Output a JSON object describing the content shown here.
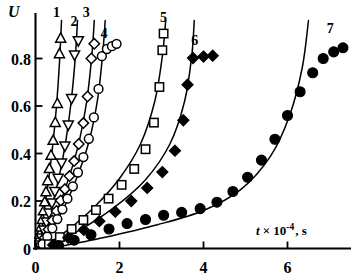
{
  "chart_data": {
    "type": "scatter",
    "title": "",
    "xlabel": "t × 10⁻⁴, s",
    "ylabel": "U",
    "xlim": [
      -0.15,
      7.6
    ],
    "ylim": [
      -0.02,
      0.97
    ],
    "xticks": [
      0,
      2,
      4,
      6
    ],
    "xticklabels": [
      "0",
      "2",
      "4",
      "6"
    ],
    "yticks": [
      0,
      0.2,
      0.4,
      0.6,
      0.8
    ],
    "yticklabels": [
      "0",
      "0.2",
      "0.4",
      "0.6",
      "0.8"
    ],
    "grid": false,
    "legend_position": "inline-curve-labels",
    "axis_label_u": "U",
    "axis_label_t_var": "t",
    "axis_label_t_mult": "× 10",
    "axis_label_t_exp": "-4",
    "axis_label_t_unit": ", s",
    "series": [
      {
        "name": "1",
        "label": "1",
        "marker": "triangle-up",
        "filled": false,
        "label_x": 0.5,
        "label_y": 0.975,
        "points": [
          {
            "x": 0.04,
            "y": 0.012
          },
          {
            "x": 0.07,
            "y": 0.035
          },
          {
            "x": 0.1,
            "y": 0.06
          },
          {
            "x": 0.13,
            "y": 0.09
          },
          {
            "x": 0.16,
            "y": 0.122
          },
          {
            "x": 0.19,
            "y": 0.158
          },
          {
            "x": 0.22,
            "y": 0.196
          },
          {
            "x": 0.25,
            "y": 0.238
          },
          {
            "x": 0.29,
            "y": 0.285
          },
          {
            "x": 0.33,
            "y": 0.336
          },
          {
            "x": 0.37,
            "y": 0.392
          },
          {
            "x": 0.42,
            "y": 0.455
          },
          {
            "x": 0.47,
            "y": 0.53
          },
          {
            "x": 0.52,
            "y": 0.61
          },
          {
            "x": 0.57,
            "y": 0.82
          },
          {
            "x": 0.6,
            "y": 0.885
          }
        ],
        "curve": [
          {
            "x": 0.02,
            "y": 0.0
          },
          {
            "x": 0.12,
            "y": 0.075
          },
          {
            "x": 0.22,
            "y": 0.175
          },
          {
            "x": 0.32,
            "y": 0.3
          },
          {
            "x": 0.42,
            "y": 0.45
          },
          {
            "x": 0.5,
            "y": 0.6
          },
          {
            "x": 0.57,
            "y": 0.78
          },
          {
            "x": 0.62,
            "y": 0.96
          }
        ]
      },
      {
        "name": "2",
        "label": "2",
        "marker": "triangle-down",
        "filled": false,
        "label_x": 0.92,
        "label_y": 0.935,
        "points": [
          {
            "x": 0.08,
            "y": 0.015
          },
          {
            "x": 0.14,
            "y": 0.045
          },
          {
            "x": 0.2,
            "y": 0.078
          },
          {
            "x": 0.26,
            "y": 0.112
          },
          {
            "x": 0.32,
            "y": 0.15
          },
          {
            "x": 0.39,
            "y": 0.192
          },
          {
            "x": 0.46,
            "y": 0.24
          },
          {
            "x": 0.54,
            "y": 0.296
          },
          {
            "x": 0.62,
            "y": 0.36
          },
          {
            "x": 0.7,
            "y": 0.432
          },
          {
            "x": 0.78,
            "y": 0.52
          },
          {
            "x": 0.86,
            "y": 0.632
          },
          {
            "x": 0.93,
            "y": 0.815
          },
          {
            "x": 1.02,
            "y": 0.875
          }
        ],
        "curve": [
          {
            "x": 0.04,
            "y": 0.0
          },
          {
            "x": 0.2,
            "y": 0.07
          },
          {
            "x": 0.38,
            "y": 0.17
          },
          {
            "x": 0.56,
            "y": 0.3
          },
          {
            "x": 0.72,
            "y": 0.45
          },
          {
            "x": 0.85,
            "y": 0.62
          },
          {
            "x": 0.95,
            "y": 0.81
          },
          {
            "x": 1.0,
            "y": 0.96
          }
        ]
      },
      {
        "name": "3",
        "label": "3",
        "marker": "diamond",
        "filled": false,
        "label_x": 1.21,
        "label_y": 0.975,
        "points": [
          {
            "x": 0.13,
            "y": 0.015
          },
          {
            "x": 0.22,
            "y": 0.045
          },
          {
            "x": 0.31,
            "y": 0.08
          },
          {
            "x": 0.4,
            "y": 0.118
          },
          {
            "x": 0.5,
            "y": 0.158
          },
          {
            "x": 0.6,
            "y": 0.202
          },
          {
            "x": 0.7,
            "y": 0.25
          },
          {
            "x": 0.81,
            "y": 0.305
          },
          {
            "x": 0.92,
            "y": 0.368
          },
          {
            "x": 1.03,
            "y": 0.44
          },
          {
            "x": 1.14,
            "y": 0.528
          },
          {
            "x": 1.24,
            "y": 0.64
          },
          {
            "x": 1.33,
            "y": 0.8
          },
          {
            "x": 1.4,
            "y": 0.862
          }
        ],
        "curve": [
          {
            "x": 0.06,
            "y": 0.0
          },
          {
            "x": 0.3,
            "y": 0.075
          },
          {
            "x": 0.55,
            "y": 0.175
          },
          {
            "x": 0.8,
            "y": 0.3
          },
          {
            "x": 1.04,
            "y": 0.45
          },
          {
            "x": 1.22,
            "y": 0.62
          },
          {
            "x": 1.34,
            "y": 0.81
          },
          {
            "x": 1.4,
            "y": 0.96
          }
        ]
      },
      {
        "name": "4",
        "label": "4",
        "marker": "circle",
        "filled": false,
        "label_x": 1.63,
        "label_y": 0.885,
        "points": [
          {
            "x": 0.17,
            "y": 0.018
          },
          {
            "x": 0.28,
            "y": 0.05
          },
          {
            "x": 0.4,
            "y": 0.085
          },
          {
            "x": 0.52,
            "y": 0.124
          },
          {
            "x": 0.64,
            "y": 0.165
          },
          {
            "x": 0.76,
            "y": 0.21
          },
          {
            "x": 0.89,
            "y": 0.262
          },
          {
            "x": 1.01,
            "y": 0.32
          },
          {
            "x": 1.14,
            "y": 0.385
          },
          {
            "x": 1.27,
            "y": 0.462
          },
          {
            "x": 1.39,
            "y": 0.552
          },
          {
            "x": 1.5,
            "y": 0.672
          },
          {
            "x": 1.58,
            "y": 0.81
          },
          {
            "x": 1.7,
            "y": 0.84
          },
          {
            "x": 1.82,
            "y": 0.852
          },
          {
            "x": 1.93,
            "y": 0.862
          }
        ],
        "curve": [
          {
            "x": 0.08,
            "y": 0.0
          },
          {
            "x": 0.38,
            "y": 0.078
          },
          {
            "x": 0.7,
            "y": 0.18
          },
          {
            "x": 1.0,
            "y": 0.305
          },
          {
            "x": 1.28,
            "y": 0.455
          },
          {
            "x": 1.48,
            "y": 0.63
          },
          {
            "x": 1.6,
            "y": 0.82
          },
          {
            "x": 1.66,
            "y": 0.96
          }
        ]
      },
      {
        "name": "5",
        "label": "5",
        "marker": "square",
        "filled": false,
        "label_x": 3.05,
        "label_y": 0.955,
        "points": [
          {
            "x": 0.32,
            "y": 0.018
          },
          {
            "x": 0.58,
            "y": 0.048
          },
          {
            "x": 0.86,
            "y": 0.082
          },
          {
            "x": 1.14,
            "y": 0.12
          },
          {
            "x": 1.44,
            "y": 0.162
          },
          {
            "x": 1.74,
            "y": 0.21
          },
          {
            "x": 2.05,
            "y": 0.268
          },
          {
            "x": 2.35,
            "y": 0.335
          },
          {
            "x": 2.62,
            "y": 0.418
          },
          {
            "x": 2.82,
            "y": 0.53
          },
          {
            "x": 2.95,
            "y": 0.68
          },
          {
            "x": 3.02,
            "y": 0.835
          },
          {
            "x": 3.05,
            "y": 0.905
          }
        ],
        "curve": [
          {
            "x": 0.14,
            "y": 0.0
          },
          {
            "x": 0.75,
            "y": 0.075
          },
          {
            "x": 1.4,
            "y": 0.175
          },
          {
            "x": 2.0,
            "y": 0.295
          },
          {
            "x": 2.5,
            "y": 0.44
          },
          {
            "x": 2.84,
            "y": 0.62
          },
          {
            "x": 3.02,
            "y": 0.81
          },
          {
            "x": 3.1,
            "y": 0.96
          }
        ]
      },
      {
        "name": "6",
        "label": "6",
        "marker": "diamond",
        "filled": true,
        "label_x": 3.79,
        "label_y": 0.855,
        "points": [
          {
            "x": 0.42,
            "y": 0.015
          },
          {
            "x": 0.78,
            "y": 0.045
          },
          {
            "x": 1.15,
            "y": 0.078
          },
          {
            "x": 1.52,
            "y": 0.115
          },
          {
            "x": 1.9,
            "y": 0.155
          },
          {
            "x": 2.28,
            "y": 0.2
          },
          {
            "x": 2.66,
            "y": 0.255
          },
          {
            "x": 3.02,
            "y": 0.322
          },
          {
            "x": 3.32,
            "y": 0.412
          },
          {
            "x": 3.52,
            "y": 0.54
          },
          {
            "x": 3.62,
            "y": 0.69
          },
          {
            "x": 3.75,
            "y": 0.802
          },
          {
            "x": 4.0,
            "y": 0.808
          },
          {
            "x": 4.22,
            "y": 0.812
          }
        ],
        "curve": [
          {
            "x": 0.2,
            "y": 0.0
          },
          {
            "x": 1.0,
            "y": 0.072
          },
          {
            "x": 1.85,
            "y": 0.17
          },
          {
            "x": 2.62,
            "y": 0.29
          },
          {
            "x": 3.2,
            "y": 0.44
          },
          {
            "x": 3.55,
            "y": 0.62
          },
          {
            "x": 3.72,
            "y": 0.81
          },
          {
            "x": 3.78,
            "y": 0.96
          }
        ]
      },
      {
        "name": "7",
        "label": "7",
        "marker": "circle",
        "filled": true,
        "label_x": 7.02,
        "label_y": 0.908,
        "points": [
          {
            "x": 0.55,
            "y": 0.012
          },
          {
            "x": 0.92,
            "y": 0.035
          },
          {
            "x": 1.32,
            "y": 0.058
          },
          {
            "x": 1.75,
            "y": 0.082
          },
          {
            "x": 2.18,
            "y": 0.105
          },
          {
            "x": 2.62,
            "y": 0.122
          },
          {
            "x": 3.05,
            "y": 0.14
          },
          {
            "x": 3.48,
            "y": 0.152
          },
          {
            "x": 3.92,
            "y": 0.168
          },
          {
            "x": 4.32,
            "y": 0.195
          },
          {
            "x": 4.7,
            "y": 0.24
          },
          {
            "x": 5.05,
            "y": 0.3
          },
          {
            "x": 5.38,
            "y": 0.372
          },
          {
            "x": 5.7,
            "y": 0.46
          },
          {
            "x": 6.0,
            "y": 0.56
          },
          {
            "x": 6.3,
            "y": 0.66
          },
          {
            "x": 6.6,
            "y": 0.74
          },
          {
            "x": 6.85,
            "y": 0.8
          },
          {
            "x": 7.1,
            "y": 0.828
          },
          {
            "x": 7.32,
            "y": 0.845
          }
        ],
        "curve": [
          {
            "x": 0.35,
            "y": 0.0
          },
          {
            "x": 1.6,
            "y": 0.045
          },
          {
            "x": 2.9,
            "y": 0.1
          },
          {
            "x": 4.0,
            "y": 0.16
          },
          {
            "x": 4.9,
            "y": 0.25
          },
          {
            "x": 5.6,
            "y": 0.39
          },
          {
            "x": 6.05,
            "y": 0.56
          },
          {
            "x": 6.35,
            "y": 0.76
          },
          {
            "x": 6.5,
            "y": 0.96
          }
        ]
      }
    ]
  }
}
